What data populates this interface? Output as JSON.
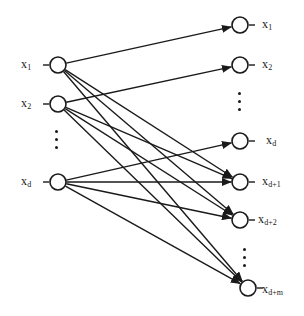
{
  "figure": {
    "type": "node-link-diagram",
    "width": 304,
    "height": 316,
    "background_color": "#ffffff",
    "ink_color": "#1a1a1a",
    "stroke_width": 1.4,
    "node_radius": 8,
    "node_fill": "#ffffff"
  },
  "input_layer": {
    "name": "input-layer",
    "x": 58,
    "stub_label_side": "left",
    "nodes": [
      {
        "id": "in-1",
        "label_base": "x",
        "label_sub": "1",
        "cx": 58,
        "cy": 65,
        "label_x": 21,
        "label_y": 58
      },
      {
        "id": "in-2",
        "label_base": "x",
        "label_sub": "2",
        "cx": 58,
        "cy": 104,
        "label_x": 21,
        "label_y": 97
      },
      {
        "id": "in-d",
        "label_base": "x",
        "label_sub": "d",
        "cx": 58,
        "cy": 182,
        "label_x": 21,
        "label_y": 175
      }
    ],
    "ellipsis": {
      "name": "input-ellipsis",
      "x": 55,
      "y": 130,
      "dots": 3
    }
  },
  "output_layer": {
    "name": "output-layer",
    "x": 240,
    "stub_label_side": "right",
    "nodes": [
      {
        "id": "out-1",
        "label_base": "x",
        "label_sub": "1",
        "cx": 240,
        "cy": 25,
        "label_x": 262,
        "label_y": 18
      },
      {
        "id": "out-2",
        "label_base": "x",
        "label_sub": "2",
        "cx": 240,
        "cy": 65,
        "label_x": 262,
        "label_y": 58
      },
      {
        "id": "out-d",
        "label_base": "x",
        "label_sub": "d",
        "cx": 240,
        "cy": 141,
        "label_x": 266,
        "label_y": 134
      },
      {
        "id": "out-d1",
        "label_base": "x",
        "label_sub": "d+1",
        "cx": 240,
        "cy": 182,
        "label_x": 262,
        "label_y": 175
      },
      {
        "id": "out-d2",
        "label_base": "x",
        "label_sub": "d+2",
        "cx": 240,
        "cy": 220,
        "label_x": 258,
        "label_y": 213
      },
      {
        "id": "out-dm",
        "label_base": "x",
        "label_sub": "d+m",
        "cx": 248,
        "cy": 288,
        "label_x": 262,
        "label_y": 283
      }
    ],
    "ellipsis_upper": {
      "name": "output-ellipsis-upper",
      "x": 238,
      "y": 92,
      "dots": 3
    },
    "ellipsis_lower": {
      "name": "output-ellipsis-lower",
      "x": 243,
      "y": 248,
      "dots": 3
    }
  },
  "edges": [
    {
      "name": "edge-in1-out1",
      "from": "in-1",
      "to": "out-1",
      "arrow": true
    },
    {
      "name": "edge-in1-outd1",
      "from": "in-1",
      "to": "out-d1",
      "arrow": true
    },
    {
      "name": "edge-in1-outd2",
      "from": "in-1",
      "to": "out-d2",
      "arrow": true
    },
    {
      "name": "edge-in1-outdm",
      "from": "in-1",
      "to": "out-dm",
      "arrow": true
    },
    {
      "name": "edge-in2-out2",
      "from": "in-2",
      "to": "out-2",
      "arrow": true
    },
    {
      "name": "edge-in2-outd1",
      "from": "in-2",
      "to": "out-d1",
      "arrow": true
    },
    {
      "name": "edge-in2-outd2",
      "from": "in-2",
      "to": "out-d2",
      "arrow": true
    },
    {
      "name": "edge-in2-outdm",
      "from": "in-2",
      "to": "out-dm",
      "arrow": true
    },
    {
      "name": "edge-ind-outd",
      "from": "in-d",
      "to": "out-d",
      "arrow": true
    },
    {
      "name": "edge-ind-outd1",
      "from": "in-d",
      "to": "out-d1",
      "arrow": true
    },
    {
      "name": "edge-ind-outd2",
      "from": "in-d",
      "to": "out-d2",
      "arrow": true
    },
    {
      "name": "edge-ind-outdm",
      "from": "in-d",
      "to": "out-dm",
      "arrow": true
    }
  ]
}
